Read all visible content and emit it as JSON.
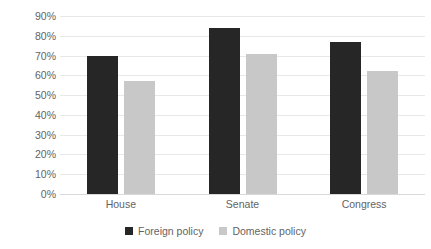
{
  "chart_data": {
    "type": "bar",
    "title": "",
    "subtitle": "",
    "xlabel": "",
    "ylabel": "",
    "categories": [
      "House",
      "Senate",
      "Congress"
    ],
    "series": [
      {
        "name": "Foreign policy",
        "color": "#262626",
        "values": [
          70,
          84,
          77
        ]
      },
      {
        "name": "Domestic policy",
        "color": "#c8c8c8",
        "values": [
          57,
          71,
          62
        ]
      }
    ],
    "ylim": [
      0,
      90
    ],
    "ytick_values": [
      90,
      80,
      70,
      60,
      50,
      40,
      30,
      20,
      10,
      0
    ],
    "ytick_labels": [
      "90%",
      "80%",
      "70%",
      "60%",
      "50%",
      "40%",
      "30%",
      "20%",
      "10%",
      "0%"
    ],
    "value_format": "percent",
    "grid": true,
    "grid_axis": "y",
    "legend_position": "bottom",
    "annotations": []
  },
  "colors": {
    "background": "#ffffff",
    "gridline": "#e8e8e8",
    "baseline": "#d9d9d9",
    "tick_text": "#636363",
    "series_foreign": "#262626",
    "series_domestic": "#c8c8c8"
  },
  "legend": {
    "items": [
      {
        "label": "Foreign policy",
        "swatch": "foreign"
      },
      {
        "label": "Domestic policy",
        "swatch": "domestic"
      }
    ]
  }
}
